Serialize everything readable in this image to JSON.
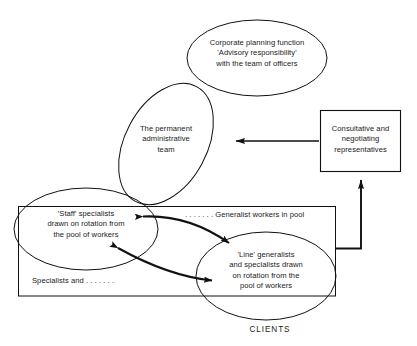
{
  "diagram": {
    "stroke_color": "#111111",
    "background_color": "#ffffff",
    "nodes": {
      "corporate_planning": {
        "label": "Corporate planning function\n'Advisory responsibility'\nwith the team of officers",
        "shape": "ellipse"
      },
      "administrative_team": {
        "label": "The permanent\nadministrative\nteam",
        "shape": "rotated-ellipse"
      },
      "representatives": {
        "label": "Consultative and\nnegotiating\nrepresentatives",
        "shape": "rectangle"
      },
      "staff_specialists": {
        "label": "'Staff' specialists\ndrawn on rotation from\nthe pool of workers",
        "shape": "ellipse"
      },
      "line_generalists": {
        "label": "'Line' generalists\nand specialists drawn\non rotation from the\npool of workers",
        "shape": "ellipse"
      },
      "generalist_pool": {
        "label": ". . . . . . . Generalist workers in pool",
        "shape": "text"
      },
      "specialists_and": {
        "label": "Specialists and . . . . . . .",
        "shape": "text"
      },
      "clients": {
        "label": "CLIENTS",
        "shape": "text"
      }
    },
    "connectors": [
      {
        "name": "representatives-to-administrative-team",
        "from": "representatives",
        "to": "administrative_team",
        "style": "straight-arrow",
        "direction": "left"
      },
      {
        "name": "pool-to-representatives",
        "from": "line_generalists",
        "to": "representatives",
        "style": "elbow-arrow",
        "direction": "up"
      },
      {
        "name": "staff-line-rotation-upper",
        "from": "staff_specialists",
        "to": "line_generalists",
        "style": "curved-double-arrow",
        "direction": "both"
      },
      {
        "name": "staff-line-rotation-lower",
        "from": "line_generalists",
        "to": "staff_specialists",
        "style": "curved-double-arrow",
        "direction": "both"
      }
    ]
  }
}
